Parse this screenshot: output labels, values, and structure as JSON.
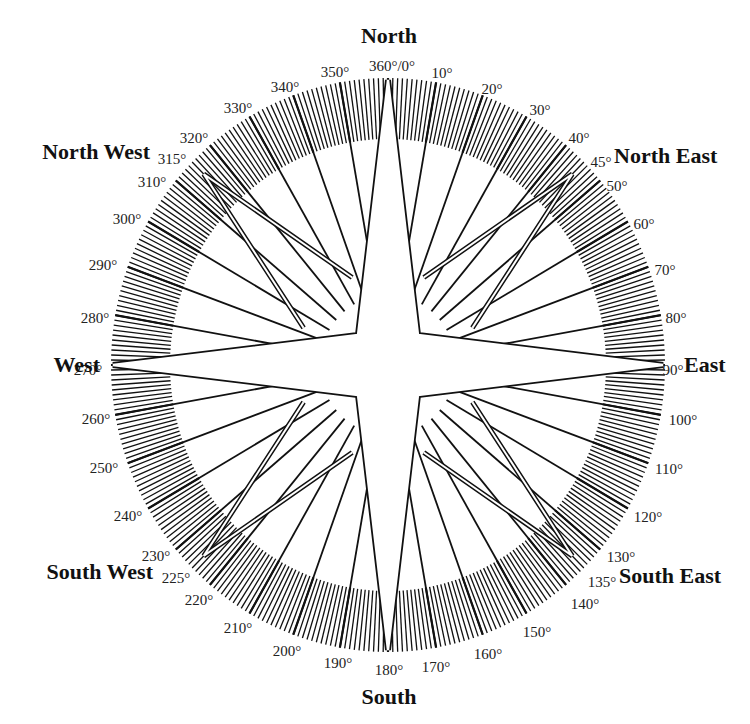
{
  "diagram": {
    "center": {
      "x": 388,
      "y": 365
    },
    "ring": {
      "outer_radius_x": 277,
      "outer_radius_y": 287,
      "inner_radius_x": 218,
      "inner_radius_y": 226
    },
    "tick_interval_deg": 1,
    "major_spoke_interval_deg": 10,
    "colors": {
      "ink": "#111111",
      "background": "#ffffff",
      "label": "#222222"
    },
    "cardinal_labels": [
      {
        "text": "North",
        "x": 389,
        "y": 43,
        "anchor": "middle"
      },
      {
        "text": "East",
        "x": 684,
        "y": 372,
        "anchor": "start"
      },
      {
        "text": "South",
        "x": 389,
        "y": 704,
        "anchor": "middle"
      },
      {
        "text": "West",
        "x": 100,
        "y": 372,
        "anchor": "end"
      }
    ],
    "intercardinal_labels": [
      {
        "text": "North East",
        "x": 614,
        "y": 163,
        "anchor": "start"
      },
      {
        "text": "South East",
        "x": 619,
        "y": 583,
        "anchor": "start"
      },
      {
        "text": "South West",
        "x": 153,
        "y": 579,
        "anchor": "end"
      },
      {
        "text": "North West",
        "x": 150,
        "y": 159,
        "anchor": "end"
      }
    ],
    "degree_labels": [
      {
        "text": "360°/0°",
        "x": 392,
        "y": 66,
        "anchor": "middle"
      },
      {
        "text": "10°",
        "x": 442,
        "y": 73,
        "anchor": "middle"
      },
      {
        "text": "20°",
        "x": 492,
        "y": 89,
        "anchor": "middle"
      },
      {
        "text": "30°",
        "x": 540,
        "y": 110,
        "anchor": "middle"
      },
      {
        "text": "40°",
        "x": 579,
        "y": 138,
        "anchor": "middle"
      },
      {
        "text": "45°",
        "x": 601,
        "y": 162,
        "anchor": "middle"
      },
      {
        "text": "50°",
        "x": 617,
        "y": 186,
        "anchor": "middle"
      },
      {
        "text": "60°",
        "x": 644,
        "y": 224,
        "anchor": "middle"
      },
      {
        "text": "70°",
        "x": 665,
        "y": 270,
        "anchor": "middle"
      },
      {
        "text": "80°",
        "x": 676,
        "y": 318,
        "anchor": "middle"
      },
      {
        "text": "90°",
        "x": 673,
        "y": 370,
        "anchor": "middle"
      },
      {
        "text": "100°",
        "x": 683,
        "y": 420,
        "anchor": "middle"
      },
      {
        "text": "110°",
        "x": 669,
        "y": 469,
        "anchor": "middle"
      },
      {
        "text": "120°",
        "x": 648,
        "y": 517,
        "anchor": "middle"
      },
      {
        "text": "130°",
        "x": 621,
        "y": 557,
        "anchor": "middle"
      },
      {
        "text": "135°",
        "x": 602,
        "y": 582,
        "anchor": "middle"
      },
      {
        "text": "140°",
        "x": 585,
        "y": 604,
        "anchor": "middle"
      },
      {
        "text": "150°",
        "x": 537,
        "y": 632,
        "anchor": "middle"
      },
      {
        "text": "160°",
        "x": 488,
        "y": 654,
        "anchor": "middle"
      },
      {
        "text": "170°",
        "x": 436,
        "y": 667,
        "anchor": "middle"
      },
      {
        "text": "180°",
        "x": 389,
        "y": 670,
        "anchor": "middle"
      },
      {
        "text": "190°",
        "x": 338,
        "y": 663,
        "anchor": "middle"
      },
      {
        "text": "200°",
        "x": 287,
        "y": 651,
        "anchor": "middle"
      },
      {
        "text": "210°",
        "x": 238,
        "y": 628,
        "anchor": "middle"
      },
      {
        "text": "220°",
        "x": 199,
        "y": 600,
        "anchor": "middle"
      },
      {
        "text": "225°",
        "x": 176,
        "y": 578,
        "anchor": "middle"
      },
      {
        "text": "230°",
        "x": 156,
        "y": 556,
        "anchor": "middle"
      },
      {
        "text": "240°",
        "x": 128,
        "y": 516,
        "anchor": "middle"
      },
      {
        "text": "250°",
        "x": 104,
        "y": 468,
        "anchor": "middle"
      },
      {
        "text": "260°",
        "x": 96,
        "y": 419,
        "anchor": "middle"
      },
      {
        "text": "270°",
        "x": 88,
        "y": 370,
        "anchor": "middle"
      },
      {
        "text": "280°",
        "x": 95,
        "y": 318,
        "anchor": "middle"
      },
      {
        "text": "290°",
        "x": 103,
        "y": 265,
        "anchor": "middle"
      },
      {
        "text": "300°",
        "x": 127,
        "y": 219,
        "anchor": "middle"
      },
      {
        "text": "310°",
        "x": 152,
        "y": 182,
        "anchor": "middle"
      },
      {
        "text": "315°",
        "x": 172,
        "y": 159,
        "anchor": "middle"
      },
      {
        "text": "320°",
        "x": 194,
        "y": 138,
        "anchor": "middle"
      },
      {
        "text": "330°",
        "x": 238,
        "y": 108,
        "anchor": "middle"
      },
      {
        "text": "340°",
        "x": 285,
        "y": 87,
        "anchor": "middle"
      },
      {
        "text": "350°",
        "x": 335,
        "y": 72,
        "anchor": "middle"
      }
    ],
    "star": {
      "cardinal_tip_radius": 285,
      "inner_vertex_offset": 30,
      "diagonal_tip_radius": 270,
      "diagonal_base_radius": 95
    }
  }
}
